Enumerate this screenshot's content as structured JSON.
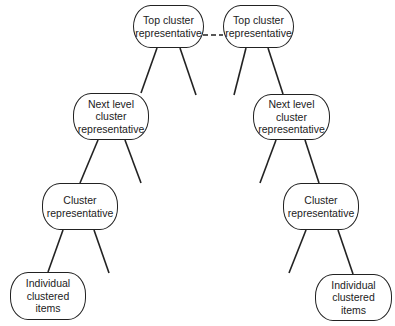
{
  "diagram": {
    "nodes": {
      "top_left": {
        "line1": "Top cluster",
        "line2": "representative"
      },
      "top_right": {
        "line1": "Top cluster",
        "line2": "representative"
      },
      "next_left": {
        "line1": "Next level cluster",
        "line2": "representative"
      },
      "next_right": {
        "line1": "Next level cluster",
        "line2": "representative"
      },
      "cluster_left": {
        "line1": "Cluster",
        "line2": "representative"
      },
      "cluster_right": {
        "line1": "Cluster",
        "line2": "representative"
      },
      "items_left": {
        "line1": "Individual",
        "line2": "clustered",
        "line3": "items"
      },
      "items_right": {
        "line1": "Individual",
        "line2": "clustered",
        "line3": "items"
      }
    },
    "colors": {
      "stroke": "#222222",
      "background": "#ffffff"
    }
  }
}
